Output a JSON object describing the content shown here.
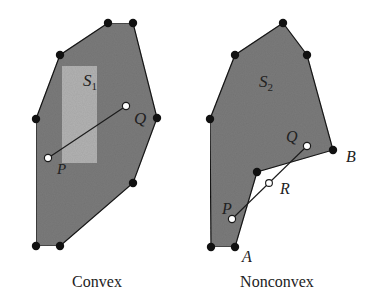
{
  "figure": {
    "colors": {
      "region_fill": "#7d7d7d",
      "subset_fill": "#b4b4b4",
      "edge": "#1a1a1a",
      "vertex": "#111111",
      "open_point": "#ffffff",
      "background": "#ffffff"
    },
    "convex": {
      "caption": "Convex",
      "set_label": "S",
      "set_subscript": "1",
      "polygon": [
        [
          108,
          23
        ],
        [
          133,
          23
        ],
        [
          157,
          118
        ],
        [
          133,
          183
        ],
        [
          60,
          246
        ],
        [
          36,
          246
        ],
        [
          36,
          119
        ],
        [
          60,
          55
        ]
      ],
      "vertices": [
        [
          108,
          23
        ],
        [
          133,
          23
        ],
        [
          157,
          118
        ],
        [
          133,
          183
        ],
        [
          60,
          246
        ],
        [
          36,
          246
        ],
        [
          36,
          119
        ],
        [
          60,
          55
        ]
      ],
      "subset_rect": {
        "x": 62,
        "y": 66,
        "w": 35,
        "h": 97
      },
      "points": {
        "P": {
          "label": "P",
          "x": 48,
          "y": 158
        },
        "Q": {
          "label": "Q",
          "x": 126,
          "y": 106
        }
      }
    },
    "nonconvex": {
      "caption": "Nonconvex",
      "set_label": "S",
      "set_subscript": "2",
      "polygon": [
        [
          283,
          23
        ],
        [
          307,
          55
        ],
        [
          333,
          150
        ],
        [
          257,
          172
        ],
        [
          235,
          247
        ],
        [
          211,
          247
        ],
        [
          210,
          119
        ],
        [
          235,
          55
        ]
      ],
      "vertices": [
        [
          283,
          23
        ],
        [
          307,
          55
        ],
        [
          333,
          150
        ],
        [
          257,
          172
        ],
        [
          235,
          247
        ],
        [
          211,
          247
        ],
        [
          210,
          119
        ],
        [
          235,
          55
        ]
      ],
      "points": {
        "P": {
          "label": "P",
          "x": 232,
          "y": 219
        },
        "Q": {
          "label": "Q",
          "x": 307,
          "y": 146
        },
        "R": {
          "label": "R",
          "x": 269,
          "y": 183
        }
      },
      "vertex_labels": {
        "A": {
          "label": "A",
          "x": 235,
          "y": 247
        },
        "B": {
          "label": "B",
          "x": 333,
          "y": 150
        }
      }
    }
  }
}
